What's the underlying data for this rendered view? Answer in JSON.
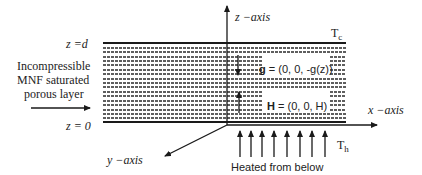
{
  "diagram": {
    "type": "porous-layer-schematic",
    "labels": {
      "z_axis": "z −axis",
      "x_axis": "x −axis",
      "y_axis": "y −axis",
      "top_boundary": "z =d",
      "bottom_boundary": "z = 0",
      "layer_line1": "Incompressible",
      "layer_line2": "MNF  saturated",
      "layer_line3": "porous layer",
      "cold_temp": "T",
      "cold_temp_sub": "c",
      "hot_temp": "T",
      "hot_temp_sub": "h",
      "heating": "Heated from below"
    },
    "vectors": {
      "gravity_symbol": "g",
      "gravity_value": " = (0, 0, -g(z))",
      "field_symbol": "H",
      "field_value": " = (0, 0, H)"
    },
    "colors": {
      "line": "#1a1a1a",
      "background": "#ffffff"
    },
    "heating_arrow_count": 8
  }
}
